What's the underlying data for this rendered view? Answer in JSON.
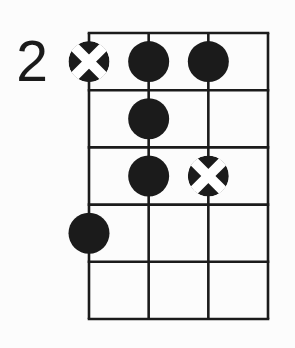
{
  "diagram": {
    "kind": "chord-diagram",
    "position_label": "2",
    "starting_fret": 2,
    "strings": 4,
    "fret_rows": 5,
    "dots": [
      {
        "string": 1,
        "fret": 1,
        "type": "crossed"
      },
      {
        "string": 2,
        "fret": 1,
        "type": "filled"
      },
      {
        "string": 3,
        "fret": 1,
        "type": "filled"
      },
      {
        "string": 2,
        "fret": 2,
        "type": "filled"
      },
      {
        "string": 2,
        "fret": 3,
        "type": "filled"
      },
      {
        "string": 3,
        "fret": 3,
        "type": "crossed"
      },
      {
        "string": 1,
        "fret": 4,
        "type": "filled"
      }
    ],
    "colors": {
      "ink": "#1b1b1b",
      "background": "#fcfcfc",
      "cross": "#ffffff"
    }
  }
}
